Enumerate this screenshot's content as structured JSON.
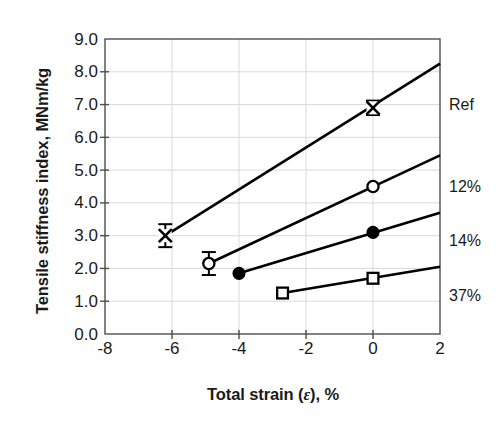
{
  "chart_data": {
    "type": "line",
    "title": "",
    "xlabel": "Total strain (ε), %",
    "ylabel": "Tensile stiffness index, MNm/kg",
    "xlim": [
      -8,
      2
    ],
    "ylim": [
      0.0,
      9.0
    ],
    "xticks": [
      -8,
      -6,
      -4,
      -2,
      0,
      2
    ],
    "xtick_labels": [
      "-8",
      "-6",
      "-4",
      "-2",
      "0",
      "2"
    ],
    "yticks": [
      0.0,
      1.0,
      2.0,
      3.0,
      4.0,
      5.0,
      6.0,
      7.0,
      8.0,
      9.0
    ],
    "ytick_labels": [
      "0.0",
      "1.0",
      "2.0",
      "3.0",
      "4.0",
      "5.0",
      "6.0",
      "7.0",
      "8.0",
      "9.0"
    ],
    "grid": true,
    "grid_color": "#d9d9d9",
    "legend_position": "right-inline-end-of-line",
    "line_color": "#000000",
    "series": [
      {
        "name": "Ref",
        "label": "Ref",
        "marker": "cross-x",
        "points": [
          {
            "x": -6.2,
            "y": 3.0,
            "yerr": 0.35
          },
          {
            "x": 0.0,
            "y": 6.9,
            "yerr": 0.22
          }
        ],
        "fit_line": {
          "x0": -6.2,
          "y0": 3.0,
          "x1": 2.0,
          "y1": 8.25
        },
        "label_x": 2.0,
        "label_y": 7.0
      },
      {
        "name": "12%",
        "label": "12%",
        "marker": "open-circle",
        "points": [
          {
            "x": -4.9,
            "y": 2.15,
            "yerr": 0.35
          },
          {
            "x": 0.0,
            "y": 4.5,
            "yerr": 0.0
          }
        ],
        "fit_line": {
          "x0": -4.9,
          "y0": 2.15,
          "x1": 2.0,
          "y1": 5.45
        },
        "label_x": 2.0,
        "label_y": 4.5
      },
      {
        "name": "14%",
        "label": "14%",
        "marker": "filled-circle",
        "points": [
          {
            "x": -4.0,
            "y": 1.85,
            "yerr": 0.0
          },
          {
            "x": 0.0,
            "y": 3.1,
            "yerr": 0.0
          }
        ],
        "fit_line": {
          "x0": -4.0,
          "y0": 1.85,
          "x1": 2.0,
          "y1": 3.7
        },
        "label_x": 2.0,
        "label_y": 2.85
      },
      {
        "name": "37%",
        "label": "37%",
        "marker": "open-square",
        "points": [
          {
            "x": -2.7,
            "y": 1.25,
            "yerr": 0.0
          },
          {
            "x": 0.0,
            "y": 1.7,
            "yerr": 0.0
          }
        ],
        "fit_line": {
          "x0": -2.7,
          "y0": 1.25,
          "x1": 2.0,
          "y1": 2.05
        },
        "label_x": 2.0,
        "label_y": 1.15
      }
    ]
  }
}
